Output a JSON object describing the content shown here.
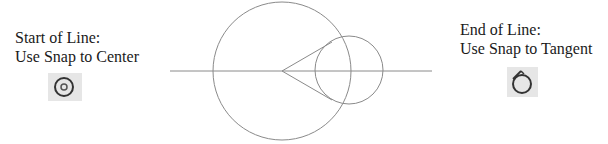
{
  "captions": {
    "start": {
      "line1": "Start of Line:",
      "line2": "Use Snap to Center"
    },
    "end": {
      "line1": "End of Line:",
      "line2": "Use Snap to Tangent"
    }
  },
  "icons": {
    "start": "snap-to-center-icon",
    "end": "snap-to-tangent-icon"
  },
  "colors": {
    "stroke": "#8a8a8a",
    "icon_bg": "#e6e6e6",
    "icon_stroke": "#333333",
    "text": "#1a1a1a"
  },
  "geometry": {
    "horizontal_line": {
      "x1": 170,
      "y1": 71,
      "x2": 432,
      "y2": 71
    },
    "large_circle": {
      "cx": 282,
      "cy": 71,
      "r": 69
    },
    "small_circle": {
      "cx": 349,
      "cy": 70,
      "r": 34
    },
    "tangent_lines": [
      {
        "x1": 282,
        "y1": 71,
        "x2": 332,
        "y2": 42
      },
      {
        "x1": 282,
        "y1": 71,
        "x2": 332,
        "y2": 100
      }
    ]
  }
}
